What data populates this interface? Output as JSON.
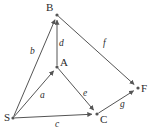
{
  "diagram": {
    "type": "directed-graph",
    "width": 153,
    "height": 136,
    "background_color": "#ffffff",
    "line_color": "#555555",
    "text_color": "#2b2b2b",
    "nodes": [
      {
        "id": "S",
        "label": "S",
        "x": 13,
        "y": 118,
        "label_x": 4,
        "label_y": 121
      },
      {
        "id": "A",
        "label": "A",
        "x": 57,
        "y": 67,
        "label_x": 60,
        "label_y": 66
      },
      {
        "id": "B",
        "label": "B",
        "x": 57,
        "y": 15,
        "label_x": 46,
        "label_y": 11
      },
      {
        "id": "C",
        "label": "C",
        "x": 97,
        "y": 114,
        "label_x": 100,
        "label_y": 123
      },
      {
        "id": "F",
        "label": "F",
        "x": 138,
        "y": 88,
        "label_x": 141,
        "label_y": 92
      }
    ],
    "edges": [
      {
        "id": "a",
        "label": "a",
        "from": "S",
        "to": "A",
        "label_x": 40,
        "label_y": 98,
        "directed": true
      },
      {
        "id": "b",
        "label": "b",
        "from": "S",
        "to": "B",
        "label_x": 30,
        "label_y": 54,
        "directed": true
      },
      {
        "id": "c",
        "label": "c",
        "from": "S",
        "to": "C",
        "label_x": 55,
        "label_y": 127,
        "directed": true
      },
      {
        "id": "d",
        "label": "d",
        "from": "A",
        "to": "B",
        "label_x": 59,
        "label_y": 46,
        "directed": true
      },
      {
        "id": "e",
        "label": "e",
        "from": "A",
        "to": "C",
        "label_x": 83,
        "label_y": 96,
        "directed": true
      },
      {
        "id": "f",
        "label": "f",
        "from": "B",
        "to": "F",
        "label_x": 103,
        "label_y": 46,
        "directed": true
      },
      {
        "id": "g",
        "label": "g",
        "from": "C",
        "to": "F",
        "label_x": 120,
        "label_y": 107,
        "directed": true
      }
    ]
  }
}
